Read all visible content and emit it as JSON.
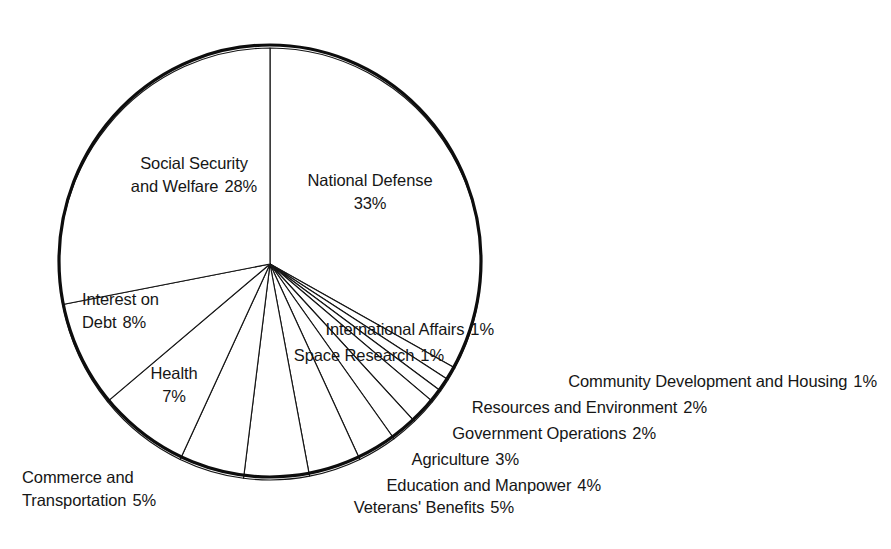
{
  "chart_data": {
    "type": "pie",
    "title": "",
    "subtitle": "",
    "xlabel": "",
    "ylabel": "",
    "legend_position": "none",
    "grid": false,
    "units": "percent",
    "total": 100,
    "start_angle_deg": 0,
    "direction": "clockwise",
    "categories": [
      "National Defense",
      "International Affairs",
      "Space Research",
      "Community Development and Housing",
      "Resources and Environment",
      "Government Operations",
      "Agriculture",
      "Education and Manpower",
      "Veterans' Benefits",
      "Commerce and Transportation",
      "Health",
      "Interest on Debt",
      "Social Security and Welfare"
    ],
    "values": [
      33,
      1,
      1,
      1,
      2,
      2,
      3,
      4,
      5,
      5,
      7,
      8,
      28
    ],
    "slices": [
      {
        "label": "National Defense",
        "value": 33,
        "pct_text": "33%",
        "label_placement": "inside"
      },
      {
        "label": "International Affairs",
        "value": 1,
        "pct_text": "1%",
        "label_placement": "outside-right"
      },
      {
        "label": "Space Research",
        "value": 1,
        "pct_text": "1%",
        "label_placement": "outside-right"
      },
      {
        "label": "Community Development and Housing",
        "value": 1,
        "pct_text": "1%",
        "label_placement": "outside-right"
      },
      {
        "label": "Resources and Environment",
        "value": 2,
        "pct_text": "2%",
        "label_placement": "outside-right"
      },
      {
        "label": "Government Operations",
        "value": 2,
        "pct_text": "2%",
        "label_placement": "outside-right"
      },
      {
        "label": "Agriculture",
        "value": 3,
        "pct_text": "3%",
        "label_placement": "outside-right"
      },
      {
        "label": "Education and Manpower",
        "value": 4,
        "pct_text": "4%",
        "label_placement": "outside-bottom"
      },
      {
        "label": "Veterans' Benefits",
        "value": 5,
        "pct_text": "5%",
        "label_placement": "outside-bottom"
      },
      {
        "label": "Commerce and Transportation",
        "value": 5,
        "pct_text": "5%",
        "label_placement": "outside-left"
      },
      {
        "label": "Health",
        "value": 7,
        "pct_text": "7%",
        "label_placement": "inside"
      },
      {
        "label": "Interest on Debt",
        "value": 8,
        "pct_text": "8%",
        "label_placement": "inside"
      },
      {
        "label": "Social Security and Welfare",
        "value": 28,
        "pct_text": "28%",
        "label_placement": "inside"
      }
    ]
  },
  "labels": {
    "social_security": {
      "line1": "Social Security",
      "line2": "and Welfare",
      "pct": "28%"
    },
    "national_defense": {
      "line1": "National Defense",
      "pct": "33%"
    },
    "interest_on_debt": {
      "line1": "Interest on",
      "line2": "Debt",
      "pct": "8%"
    },
    "health": {
      "line1": "Health",
      "pct": "7%"
    },
    "commerce": {
      "line1": "Commerce and",
      "line2": "Transportation",
      "pct": "5%"
    },
    "international_affairs": {
      "text": "International Affairs",
      "pct": "1%"
    },
    "space_research": {
      "text": "Space Research",
      "pct": "1%"
    },
    "community_development": {
      "text": "Community Development and Housing",
      "pct": "1%"
    },
    "resources_environment": {
      "text": "Resources and Environment",
      "pct": "2%"
    },
    "government_operations": {
      "text": "Government Operations",
      "pct": "2%"
    },
    "agriculture": {
      "text": "Agriculture",
      "pct": "3%"
    },
    "education_manpower": {
      "text": "Education and Manpower",
      "pct": "4%"
    },
    "veterans_benefits": {
      "text": "Veterans' Benefits",
      "pct": "5%"
    }
  },
  "colors": {
    "background": "#ffffff",
    "stroke": "#141414",
    "outline": "#0d0d0d",
    "text": "#161616",
    "slice_fill": "#ffffff"
  },
  "geometry": {
    "center_x": 270,
    "center_y": 264,
    "radius_x": 211,
    "radius_y": 216
  }
}
